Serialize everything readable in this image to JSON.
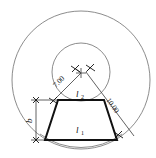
{
  "figure": {
    "background_color": "#ffffff",
    "outline_color": "#111111",
    "construction_color": "#6e6e6e",
    "dimension_color": "#3a3a3a",
    "width_px": 156,
    "height_px": 158
  },
  "dimensions": [
    {
      "id": "radius-inner",
      "label": "7.00",
      "kind": "radius",
      "value": 7.0,
      "orientation": "diagonal-upper-left"
    },
    {
      "id": "radius-outer",
      "label": "10.00",
      "kind": "radius",
      "value": 10.0,
      "orientation": "diagonal-lower-right"
    },
    {
      "id": "height-b",
      "label": "b",
      "kind": "linear-vertical",
      "orientation": "vertical-left"
    }
  ],
  "edge_labels": [
    {
      "id": "upper-edge",
      "symbol": "l",
      "subscript": "2",
      "label": "l2",
      "position": "top-of-trapezoid"
    },
    {
      "id": "lower-edge",
      "symbol": "l",
      "subscript": "1",
      "label": "l1",
      "position": "bottom-of-trapezoid"
    }
  ],
  "construction": {
    "outer_circle": {
      "cx": 81,
      "cy": 80,
      "r": 69
    },
    "inner_circle": {
      "cx": 81,
      "cy": 72,
      "r": 29
    },
    "center_mark": {
      "cx": 81,
      "cy": 73
    }
  },
  "shape": {
    "type": "trapezoid",
    "vertices": [
      {
        "x": 58,
        "y": 100
      },
      {
        "x": 104,
        "y": 100
      },
      {
        "x": 117,
        "y": 140
      },
      {
        "x": 45,
        "y": 140
      }
    ]
  }
}
